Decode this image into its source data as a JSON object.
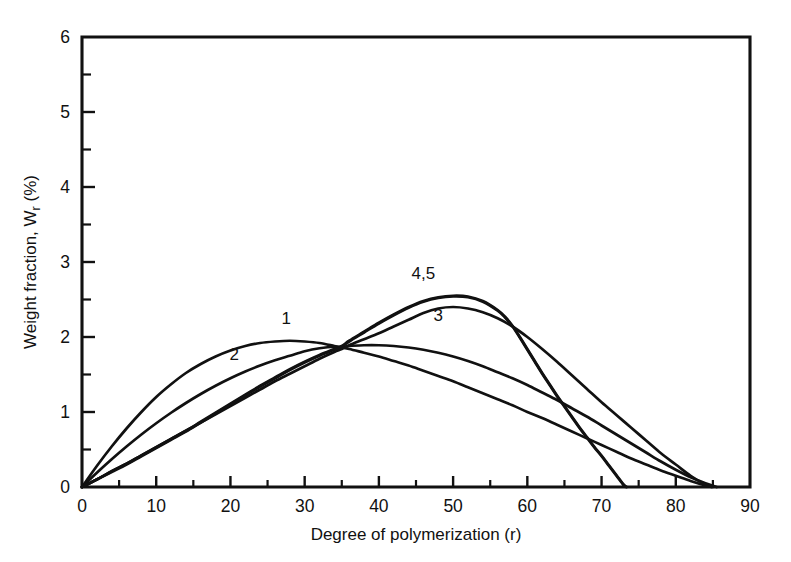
{
  "chart_data": {
    "type": "line",
    "title": "",
    "xlabel": "Degree of polymerization (r)",
    "ylabel": "Weight fraction, W_r (%)",
    "ylabel_display": "Weight fraction, W",
    "ylabel_sub": "r",
    "ylabel_unit": " (%)",
    "xlim": [
      0,
      90
    ],
    "ylim": [
      0,
      6
    ],
    "xticks": [
      0,
      10,
      20,
      30,
      40,
      50,
      60,
      70,
      80,
      90
    ],
    "xticklabels": [
      "0",
      "10",
      "20",
      "30",
      "40",
      "50",
      "60",
      "70",
      "80",
      "90"
    ],
    "xtick_minor_step": 5,
    "yticks": [
      0,
      1,
      2,
      3,
      4,
      5,
      6
    ],
    "yticklabels": [
      "0",
      "1",
      "2",
      "3",
      "4",
      "5",
      "6"
    ],
    "ytick_minor_step": 0.5,
    "grid": false,
    "legend": "inline curve labels",
    "line_color": "#111111",
    "background_color": "#ffffff",
    "common_crossing_point": {
      "x": 35,
      "y": 1.8
    },
    "series": [
      {
        "name": "1",
        "label": "1",
        "label_position": {
          "x": 27.5,
          "y": 2.17
        },
        "peak": {
          "x": 28,
          "y": 1.95
        },
        "zero_crossing_x": 84,
        "points": [
          [
            0,
            0
          ],
          [
            2,
            0.28
          ],
          [
            4,
            0.54
          ],
          [
            6,
            0.78
          ],
          [
            8,
            1.0
          ],
          [
            10,
            1.2
          ],
          [
            12,
            1.37
          ],
          [
            14,
            1.52
          ],
          [
            16,
            1.64
          ],
          [
            18,
            1.74
          ],
          [
            20,
            1.82
          ],
          [
            22,
            1.88
          ],
          [
            24,
            1.92
          ],
          [
            26,
            1.94
          ],
          [
            28,
            1.95
          ],
          [
            30,
            1.94
          ],
          [
            32,
            1.92
          ],
          [
            34,
            1.88
          ],
          [
            35,
            1.86
          ],
          [
            36,
            1.84
          ],
          [
            38,
            1.79
          ],
          [
            40,
            1.74
          ],
          [
            42,
            1.68
          ],
          [
            44,
            1.62
          ],
          [
            46,
            1.55
          ],
          [
            48,
            1.48
          ],
          [
            50,
            1.41
          ],
          [
            52,
            1.33
          ],
          [
            54,
            1.25
          ],
          [
            56,
            1.17
          ],
          [
            58,
            1.09
          ],
          [
            60,
            1.0
          ],
          [
            62,
            0.92
          ],
          [
            64,
            0.83
          ],
          [
            66,
            0.74
          ],
          [
            68,
            0.65
          ],
          [
            70,
            0.56
          ],
          [
            72,
            0.47
          ],
          [
            74,
            0.38
          ],
          [
            76,
            0.3
          ],
          [
            78,
            0.22
          ],
          [
            80,
            0.15
          ],
          [
            82,
            0.08
          ],
          [
            84,
            0.02
          ],
          [
            85,
            0.0
          ]
        ]
      },
      {
        "name": "2",
        "label": "2",
        "label_position": {
          "x": 20.5,
          "y": 1.7
        },
        "peak": {
          "x": 33,
          "y": 1.9
        },
        "zero_crossing_x": 85,
        "points": [
          [
            0,
            0
          ],
          [
            2,
            0.19
          ],
          [
            4,
            0.37
          ],
          [
            6,
            0.54
          ],
          [
            8,
            0.7
          ],
          [
            10,
            0.85
          ],
          [
            12,
            0.99
          ],
          [
            14,
            1.12
          ],
          [
            16,
            1.24
          ],
          [
            18,
            1.35
          ],
          [
            20,
            1.45
          ],
          [
            22,
            1.54
          ],
          [
            24,
            1.62
          ],
          [
            26,
            1.69
          ],
          [
            28,
            1.75
          ],
          [
            30,
            1.81
          ],
          [
            32,
            1.85
          ],
          [
            34,
            1.87
          ],
          [
            35,
            1.86
          ],
          [
            36,
            1.88
          ],
          [
            38,
            1.89
          ],
          [
            40,
            1.89
          ],
          [
            42,
            1.88
          ],
          [
            44,
            1.86
          ],
          [
            46,
            1.83
          ],
          [
            48,
            1.79
          ],
          [
            50,
            1.74
          ],
          [
            52,
            1.68
          ],
          [
            54,
            1.61
          ],
          [
            56,
            1.53
          ],
          [
            58,
            1.45
          ],
          [
            60,
            1.36
          ],
          [
            62,
            1.26
          ],
          [
            64,
            1.16
          ],
          [
            66,
            1.05
          ],
          [
            68,
            0.94
          ],
          [
            70,
            0.82
          ],
          [
            72,
            0.7
          ],
          [
            74,
            0.58
          ],
          [
            76,
            0.46
          ],
          [
            78,
            0.34
          ],
          [
            80,
            0.23
          ],
          [
            82,
            0.13
          ],
          [
            84,
            0.05
          ],
          [
            85.5,
            0.0
          ]
        ]
      },
      {
        "name": "3",
        "label": "3",
        "label_position": {
          "x": 48,
          "y": 2.22
        },
        "peak": {
          "x": 48,
          "y": 2.4
        },
        "zero_crossing_x": 84,
        "points": [
          [
            0,
            0
          ],
          [
            2,
            0.1
          ],
          [
            4,
            0.21
          ],
          [
            6,
            0.31
          ],
          [
            8,
            0.42
          ],
          [
            10,
            0.53
          ],
          [
            12,
            0.64
          ],
          [
            14,
            0.75
          ],
          [
            16,
            0.86
          ],
          [
            18,
            0.97
          ],
          [
            20,
            1.08
          ],
          [
            22,
            1.19
          ],
          [
            24,
            1.3
          ],
          [
            26,
            1.41
          ],
          [
            28,
            1.51
          ],
          [
            30,
            1.61
          ],
          [
            32,
            1.71
          ],
          [
            34,
            1.8
          ],
          [
            35,
            1.84
          ],
          [
            36,
            1.89
          ],
          [
            38,
            1.97
          ],
          [
            40,
            2.05
          ],
          [
            42,
            2.14
          ],
          [
            44,
            2.23
          ],
          [
            46,
            2.32
          ],
          [
            48,
            2.38
          ],
          [
            50,
            2.4
          ],
          [
            52,
            2.38
          ],
          [
            54,
            2.33
          ],
          [
            56,
            2.25
          ],
          [
            58,
            2.14
          ],
          [
            60,
            2.0
          ],
          [
            62,
            1.84
          ],
          [
            64,
            1.67
          ],
          [
            66,
            1.49
          ],
          [
            68,
            1.31
          ],
          [
            70,
            1.13
          ],
          [
            72,
            0.96
          ],
          [
            74,
            0.79
          ],
          [
            76,
            0.62
          ],
          [
            78,
            0.45
          ],
          [
            80,
            0.3
          ],
          [
            82,
            0.15
          ],
          [
            84,
            0.03
          ],
          [
            84.8,
            0.0
          ]
        ]
      },
      {
        "name": "4",
        "label": "4,5",
        "label_position": {
          "x": 46,
          "y": 2.78
        },
        "peak": {
          "x": 50,
          "y": 2.55
        },
        "zero_crossing_x": 73,
        "points": [
          [
            0,
            0
          ],
          [
            2,
            0.1
          ],
          [
            4,
            0.21
          ],
          [
            6,
            0.31
          ],
          [
            8,
            0.42
          ],
          [
            10,
            0.53
          ],
          [
            12,
            0.64
          ],
          [
            14,
            0.75
          ],
          [
            16,
            0.87
          ],
          [
            18,
            0.99
          ],
          [
            20,
            1.11
          ],
          [
            22,
            1.23
          ],
          [
            24,
            1.35
          ],
          [
            26,
            1.46
          ],
          [
            28,
            1.57
          ],
          [
            30,
            1.67
          ],
          [
            32,
            1.76
          ],
          [
            34,
            1.84
          ],
          [
            35,
            1.88
          ],
          [
            36,
            1.95
          ],
          [
            38,
            2.07
          ],
          [
            40,
            2.19
          ],
          [
            42,
            2.3
          ],
          [
            44,
            2.4
          ],
          [
            46,
            2.48
          ],
          [
            48,
            2.53
          ],
          [
            50,
            2.55
          ],
          [
            52,
            2.54
          ],
          [
            54,
            2.48
          ],
          [
            56,
            2.36
          ],
          [
            57,
            2.27
          ],
          [
            58,
            2.15
          ],
          [
            59,
            2.0
          ],
          [
            60,
            1.84
          ],
          [
            61,
            1.68
          ],
          [
            62,
            1.52
          ],
          [
            63,
            1.37
          ],
          [
            64,
            1.22
          ],
          [
            65,
            1.08
          ],
          [
            66,
            0.94
          ],
          [
            67,
            0.8
          ],
          [
            68,
            0.67
          ],
          [
            69,
            0.54
          ],
          [
            70,
            0.42
          ],
          [
            71,
            0.29
          ],
          [
            72,
            0.16
          ],
          [
            73,
            0.03
          ],
          [
            73.4,
            0.0
          ]
        ]
      },
      {
        "name": "5",
        "label": "",
        "label_position": null,
        "peak": {
          "x": 50,
          "y": 2.55
        },
        "zero_crossing_x": 73,
        "points": [
          [
            0,
            0
          ],
          [
            2,
            0.1
          ],
          [
            4,
            0.2
          ],
          [
            6,
            0.3
          ],
          [
            8,
            0.41
          ],
          [
            10,
            0.52
          ],
          [
            12,
            0.63
          ],
          [
            14,
            0.74
          ],
          [
            16,
            0.86
          ],
          [
            18,
            0.98
          ],
          [
            20,
            1.1
          ],
          [
            22,
            1.22
          ],
          [
            24,
            1.34
          ],
          [
            26,
            1.45
          ],
          [
            28,
            1.56
          ],
          [
            30,
            1.66
          ],
          [
            32,
            1.75
          ],
          [
            34,
            1.83
          ],
          [
            35,
            1.87
          ],
          [
            36,
            1.94
          ],
          [
            38,
            2.06
          ],
          [
            40,
            2.18
          ],
          [
            42,
            2.29
          ],
          [
            44,
            2.39
          ],
          [
            46,
            2.47
          ],
          [
            48,
            2.52
          ],
          [
            50,
            2.54
          ],
          [
            52,
            2.53
          ],
          [
            54,
            2.47
          ],
          [
            56,
            2.35
          ],
          [
            57,
            2.26
          ],
          [
            58,
            2.14
          ],
          [
            59,
            1.99
          ],
          [
            60,
            1.83
          ],
          [
            61,
            1.67
          ],
          [
            62,
            1.51
          ],
          [
            63,
            1.36
          ],
          [
            64,
            1.21
          ],
          [
            65,
            1.07
          ],
          [
            66,
            0.93
          ],
          [
            67,
            0.79
          ],
          [
            68,
            0.66
          ],
          [
            69,
            0.53
          ],
          [
            70,
            0.41
          ],
          [
            71,
            0.28
          ],
          [
            72,
            0.15
          ],
          [
            73,
            0.02
          ],
          [
            73.3,
            0.0
          ]
        ]
      }
    ]
  },
  "geometry": {
    "plot_left": 82,
    "plot_right": 750,
    "plot_top": 37,
    "plot_bottom": 487
  }
}
